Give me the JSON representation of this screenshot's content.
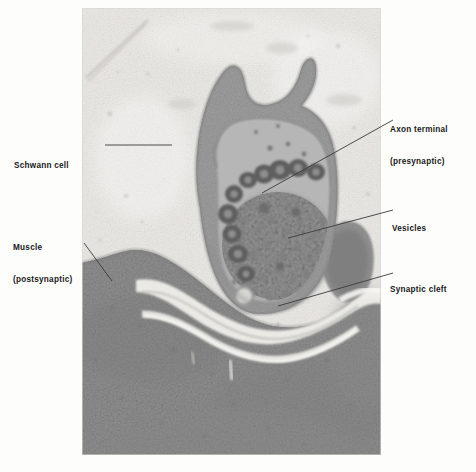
{
  "figure": {
    "type": "electron-micrograph",
    "plate": {
      "x": 82,
      "y": 8,
      "width": 299,
      "height": 447,
      "background_color": "#f2f1ee",
      "muscle_tone": "#949494",
      "terminal_tone": "#a8a8a8",
      "cleft_tone": "#efeeea"
    },
    "labels": [
      {
        "id": "schwann-cell",
        "text": "Schwann cell",
        "lines": [
          "Schwann cell"
        ],
        "side": "left",
        "text_x": 14,
        "text_y": 140,
        "leader": {
          "x1": 105,
          "y1": 145,
          "x2": 172,
          "y2": 145
        }
      },
      {
        "id": "muscle-postsynaptic",
        "text": "Muscle (postsynaptic)",
        "lines": [
          "Muscle",
          "(postsynaptic)"
        ],
        "side": "left",
        "text_x": 13,
        "text_y": 222,
        "leader": {
          "x1": 84,
          "y1": 243,
          "x2": 112,
          "y2": 281
        }
      },
      {
        "id": "axon-terminal-presynaptic",
        "text": "Axon terminal (presynaptic)",
        "lines": [
          "Axon terminal",
          "(presynaptic)"
        ],
        "side": "right",
        "text_x": 390,
        "text_y": 104,
        "leader": {
          "x1": 393,
          "y1": 120,
          "x2": 262,
          "y2": 193
        }
      },
      {
        "id": "vesicles",
        "text": "Vesicles",
        "lines": [
          "Vesicles"
        ],
        "side": "right",
        "text_x": 392,
        "text_y": 203,
        "leader": {
          "x1": 393,
          "y1": 210,
          "x2": 288,
          "y2": 238
        }
      },
      {
        "id": "synaptic-cleft",
        "text": "Synaptic cleft",
        "lines": [
          "Synaptic cleft"
        ],
        "side": "right",
        "text_x": 390,
        "text_y": 264,
        "leader": {
          "x1": 393,
          "y1": 273,
          "x2": 278,
          "y2": 306
        }
      }
    ]
  },
  "label_text": {
    "schwann_cell": "Schwann cell",
    "muscle_line1": "Muscle",
    "muscle_line2": "(postsynaptic)",
    "axon_line1": "Axon terminal",
    "axon_line2": "(presynaptic)",
    "vesicles": "Vesicles",
    "synaptic_cleft": "Synaptic cleft"
  },
  "colors": {
    "label_text": "#1a1a1a",
    "leader_line": "#3a3a3a",
    "page_background": "#fdfdfb"
  }
}
